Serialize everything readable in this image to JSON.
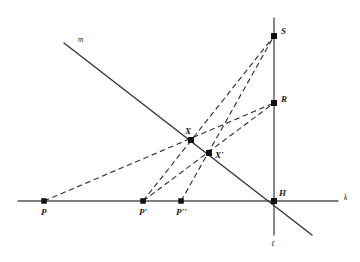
{
  "figure": {
    "background_color": "#ffffff",
    "width": 360,
    "height": 262
  },
  "style": {
    "solid_stroke": "#3a3a3a",
    "axis_stroke": "#555555",
    "dashed_stroke": "#333333",
    "point_fill": "#111111",
    "label_fill": "#1a1a1a"
  },
  "points": [
    {
      "id": "P",
      "label": "P",
      "x": 44,
      "y": 201,
      "label_x": 41,
      "label_y": 215
    },
    {
      "id": "Pp",
      "label": "P'",
      "x": 143,
      "y": 201,
      "label_x": 139,
      "label_y": 215
    },
    {
      "id": "Ppp",
      "label": "P''",
      "x": 181,
      "y": 201,
      "label_x": 176,
      "label_y": 215
    },
    {
      "id": "H",
      "label": "H",
      "x": 274,
      "y": 201,
      "label_x": 279,
      "label_y": 196
    },
    {
      "id": "X",
      "label": "X",
      "x": 191,
      "y": 140,
      "label_x": 185,
      "label_y": 134
    },
    {
      "id": "Xp",
      "label": "X'",
      "x": 209,
      "y": 153,
      "label_x": 215,
      "label_y": 158
    },
    {
      "id": "R",
      "label": "R",
      "x": 274,
      "y": 103,
      "label_x": 281,
      "label_y": 102
    },
    {
      "id": "S",
      "label": "S",
      "x": 274,
      "y": 36,
      "label_x": 281,
      "label_y": 34
    }
  ],
  "lines": [
    {
      "id": "k",
      "label": "k",
      "kind": "axis",
      "x1": 18,
      "y1": 201,
      "x2": 338,
      "y2": 201,
      "label_x": 344,
      "label_y": 200
    },
    {
      "id": "l",
      "label": "ℓ",
      "kind": "axis",
      "x1": 274,
      "y1": 18,
      "x2": 274,
      "y2": 235,
      "label_x": 271,
      "label_y": 246
    },
    {
      "id": "m",
      "label": "m",
      "kind": "solid",
      "x1": 64,
      "y1": 43,
      "x2": 312,
      "y2": 235,
      "label_x": 78,
      "label_y": 42
    }
  ],
  "dashed_paths": [
    {
      "id": "P-X-R",
      "from": "P",
      "via": "X",
      "to": "R",
      "x1": 44,
      "y1": 201,
      "x2": 274,
      "y2": 103
    },
    {
      "id": "Pp-X-S",
      "from": "P'",
      "via": "X",
      "to": "S",
      "x1": 143,
      "y1": 201,
      "x2": 274,
      "y2": 36
    },
    {
      "id": "Pp-Xp-R",
      "from": "P'",
      "via": "X'",
      "to": "R",
      "x1": 143,
      "y1": 201,
      "x2": 274,
      "y2": 103
    },
    {
      "id": "Ppp-Xp-S",
      "from": "P''",
      "via": "X'",
      "to": "S",
      "x1": 181,
      "y1": 201,
      "x2": 274,
      "y2": 36
    }
  ]
}
